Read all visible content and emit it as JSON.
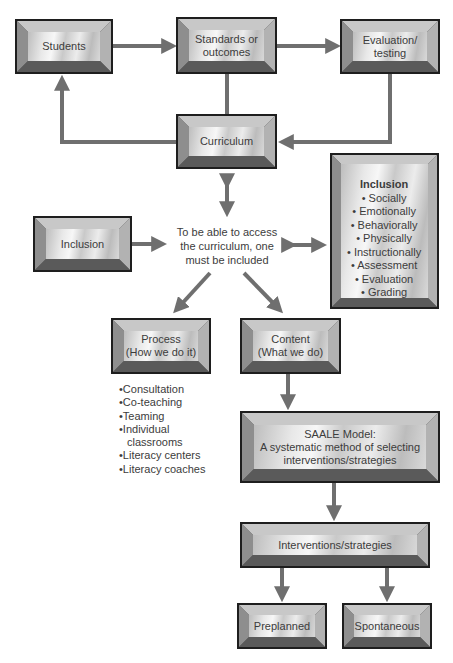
{
  "diagram": {
    "nodes": {
      "students": {
        "label": "Students"
      },
      "standards": {
        "line1": "Standards or",
        "line2": "outcomes"
      },
      "evaluation": {
        "line1": "Evaluation/",
        "line2": "testing"
      },
      "curriculum": {
        "label": "Curriculum"
      },
      "inclusion_left": {
        "label": "Inclusion"
      },
      "center_text": {
        "line1": "To be able to access",
        "line2": "the curriculum, one",
        "line3": "must be included"
      },
      "inclusion_list": {
        "title": "Inclusion",
        "items": [
          "Socially",
          "Emotionally",
          "Behaviorally",
          "Physically",
          "Instructionally",
          "Assessment",
          "Evaluation",
          "Grading"
        ]
      },
      "process": {
        "line1": "Process",
        "line2": "(How we do it)"
      },
      "content": {
        "line1": "Content",
        "line2": "(What we do)"
      },
      "process_list": {
        "items": [
          "Consultation",
          "Co-teaching",
          "Teaming",
          "Individual classrooms",
          "Literacy centers",
          "Literacy coaches"
        ]
      },
      "saale": {
        "line1": "SAALE Model:",
        "line2": "A systematic method of selecting",
        "line3": "interventions/strategies"
      },
      "interventions": {
        "label": "Interventions/strategies"
      },
      "preplanned": {
        "label": "Preplanned"
      },
      "spontaneous": {
        "label": "Spontaneous"
      }
    },
    "colors": {
      "arrow": "#6f6f6f",
      "box_border": "#1e1e1e",
      "text": "#3c3c3c"
    }
  }
}
